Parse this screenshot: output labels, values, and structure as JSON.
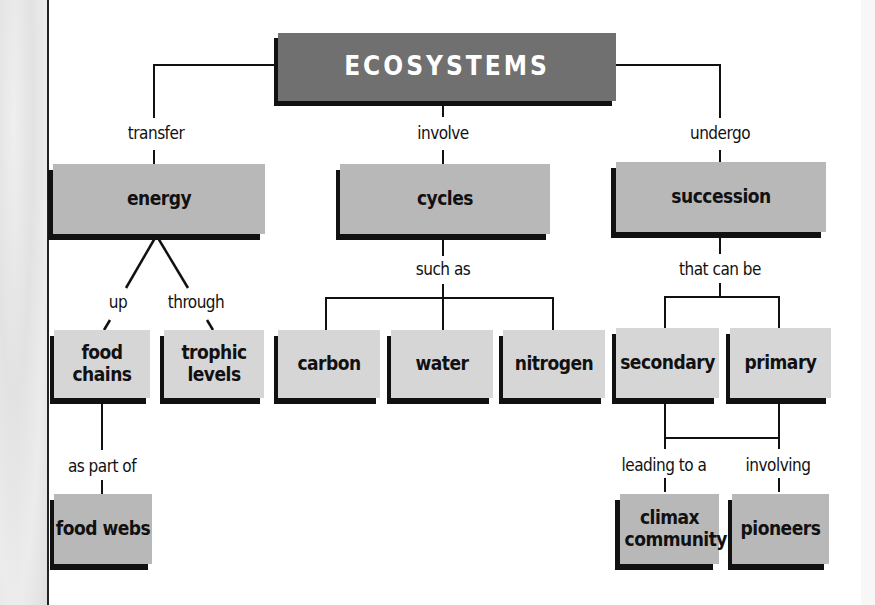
{
  "title": "ECOSYSTEMS",
  "branches": [
    {
      "link": "transfer",
      "node": "energy"
    },
    {
      "link": "involve",
      "node": "cycles"
    },
    {
      "link": "undergo",
      "node": "succession"
    }
  ],
  "energy": {
    "links": [
      "up",
      "through"
    ],
    "children": [
      "food chains",
      "trophic levels"
    ],
    "food_chains_link": "as part of",
    "food_webs": "food webs"
  },
  "cycles": {
    "link": "such as",
    "children": [
      "carbon",
      "water",
      "nitrogen"
    ]
  },
  "succession": {
    "link": "that can be",
    "children": [
      "secondary",
      "primary"
    ],
    "links2": [
      "leading to a",
      "involving"
    ],
    "children2": [
      "climax community",
      "pioneers"
    ]
  },
  "colors": {
    "title_box": "#707070",
    "node_box": "#b8b8b8",
    "leaf_box": "#d6d6d6",
    "shadow": "#111111"
  }
}
